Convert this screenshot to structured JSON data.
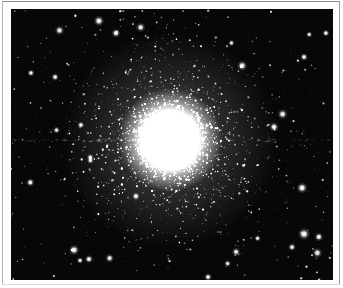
{
  "meta": {
    "domain": "astronomical-photograph"
  },
  "frame": {
    "page_background": "#ffffff",
    "keyline": {
      "top": "#8c8c8c",
      "left": "#b5b5b5",
      "right": "#9c9c9c",
      "bottom": "#dcdcdc"
    }
  },
  "photo": {
    "background": "#070707",
    "star_color": "#ffffff",
    "seed": 1337,
    "cluster": {
      "center": {
        "x": 0.494,
        "y": 0.483
      },
      "core_glow": {
        "radius": 52,
        "wide_radius": 108
      },
      "stars": {
        "count": 3300,
        "scale_inner": 26,
        "scale_outer": 54,
        "outer_fraction": 0.35,
        "max_radius": 135,
        "y_flatten": 0.93
      }
    },
    "field_stars": {
      "count": 265
    },
    "bright_stars": [
      {
        "x": 0.273,
        "y": 0.044,
        "r": 1.9
      },
      {
        "x": 0.326,
        "y": 0.089,
        "r": 1.6
      },
      {
        "x": 0.137,
        "y": 0.251,
        "r": 1.4
      },
      {
        "x": 0.062,
        "y": 0.236,
        "r": 1.3
      },
      {
        "x": 0.217,
        "y": 0.428,
        "r": 1.3
      },
      {
        "x": 0.817,
        "y": 0.435,
        "r": 1.7
      },
      {
        "x": 0.91,
        "y": 0.177,
        "r": 1.4
      },
      {
        "x": 0.978,
        "y": 0.089,
        "r": 1.3
      },
      {
        "x": 0.904,
        "y": 0.66,
        "r": 2.0
      },
      {
        "x": 0.91,
        "y": 0.83,
        "r": 2.2
      },
      {
        "x": 0.956,
        "y": 0.841,
        "r": 1.6
      },
      {
        "x": 0.196,
        "y": 0.889,
        "r": 1.9
      },
      {
        "x": 0.242,
        "y": 0.923,
        "r": 1.5
      },
      {
        "x": 0.06,
        "y": 0.64,
        "r": 1.5
      },
      {
        "x": 0.612,
        "y": 0.989,
        "r": 1.4
      }
    ],
    "scan_band": {
      "y": 0.483,
      "dash_count": 110,
      "max_alpha": 0.2
    },
    "noise_speckle": {
      "count": 1100,
      "max_alpha": 0.1
    }
  }
}
